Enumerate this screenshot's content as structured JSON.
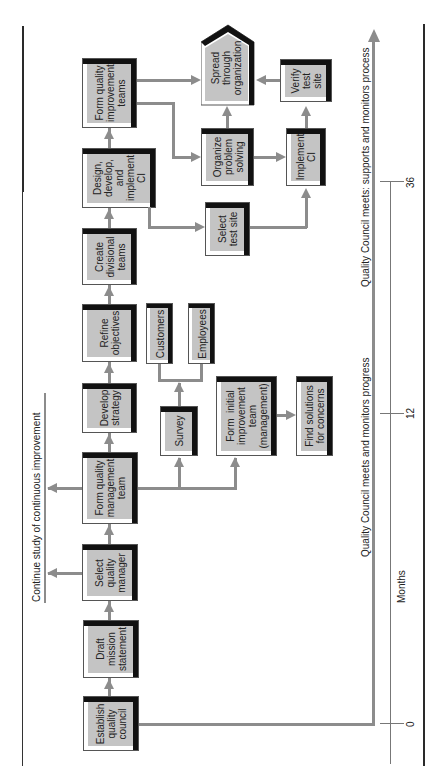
{
  "figure": {
    "orientation": "rotated-90-ccw",
    "colors": {
      "box_fill": "#c4c4c4",
      "box_shadow": "#111111",
      "connector": "#8c8c8c",
      "frame": "#2a2a2a"
    }
  },
  "main_sequence": [
    {
      "id": "establish",
      "label": "Establish\nquality\ncouncil"
    },
    {
      "id": "draft",
      "label": "Draft\nmission\nstatement"
    },
    {
      "id": "select_mgr",
      "label": "Select\nquality\nmanager"
    },
    {
      "id": "form_qmt",
      "label": "Form quality\nmanagement\nteam"
    },
    {
      "id": "develop",
      "label": "Develop\nstrategy"
    },
    {
      "id": "refine",
      "label": "Refine\nobjectives"
    },
    {
      "id": "create_div",
      "label": "Create\ndivisional\nteams"
    },
    {
      "id": "design",
      "label": "Design,\ndevelop,\nand\nimplement\nCI"
    },
    {
      "id": "form_qit",
      "label": "Form quality\nimprovement\nteams"
    }
  ],
  "branch_boxes": {
    "survey": "Survey",
    "customers": "Customers",
    "employees": "Employees",
    "form_initial": "Form  initial\nimprovement\nteam\n(management)",
    "find_solutions": "Find solutions\nfor concerns",
    "select_test_site": "Select\ntest site",
    "organize": "Organize\nproblem\nsolving",
    "implement": "Implement\nCI",
    "verify": "Verify\ntest\nsite",
    "spread": "Spread\nthrough\norganization"
  },
  "annotations": {
    "continue_study": "Continue study of continuous improvement",
    "council_progress": "Quality Council meets and monitors progress",
    "council_supports": "Quality Council meets: supports and monitors process"
  },
  "timeline": {
    "axis_label": "Months",
    "ticks": [
      "0",
      "12",
      "36"
    ]
  }
}
